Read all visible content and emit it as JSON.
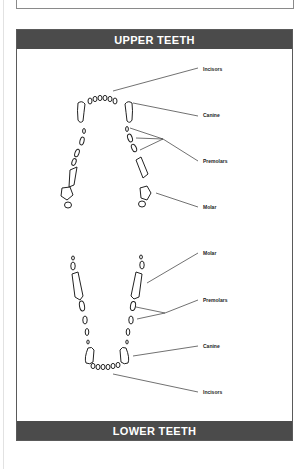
{
  "figure": {
    "header": "UPPER TEETH",
    "footer": "LOWER TEETH",
    "upper_labels": [
      {
        "text": "Incisors",
        "x": 203,
        "y": 66
      },
      {
        "text": "Canine",
        "x": 203,
        "y": 112
      },
      {
        "text": "Premolars",
        "x": 203,
        "y": 158
      },
      {
        "text": "Molar",
        "x": 203,
        "y": 204
      }
    ],
    "lower_labels": [
      {
        "text": "Molar",
        "x": 203,
        "y": 250
      },
      {
        "text": "Premolars",
        "x": 203,
        "y": 297
      },
      {
        "text": "Canine",
        "x": 203,
        "y": 343
      },
      {
        "text": "Incisors",
        "x": 203,
        "y": 389
      }
    ]
  },
  "colors": {
    "band": "#4b4b4b",
    "band_text": "#ffffff",
    "line": "#333333"
  }
}
